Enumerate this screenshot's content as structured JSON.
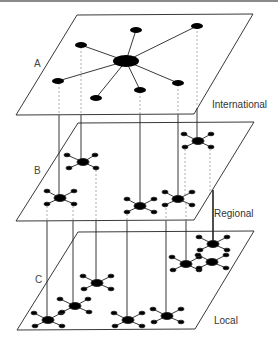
{
  "diagram": {
    "layers": [
      {
        "id": "A",
        "letter": "A",
        "label": "International"
      },
      {
        "id": "B",
        "letter": "B",
        "label": "Regional"
      },
      {
        "id": "C",
        "letter": "C",
        "label": "Local"
      }
    ],
    "colors": {
      "line": "#222222",
      "node": "#000000",
      "dashed": "#9a9a9a",
      "border": "#8a8a8a"
    }
  }
}
